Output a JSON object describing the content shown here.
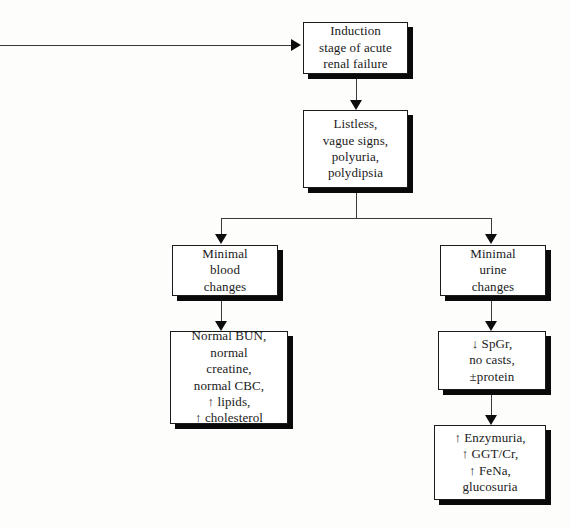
{
  "diagram": {
    "background_color": "#fdfdfc",
    "line_color": "#3a3a3a",
    "box_border_color": "#1b1b1b",
    "box_fill_color": "#ffffff",
    "shadow_color": "#0a0a0a",
    "nodes": [
      {
        "id": "induction",
        "text": "Induction\nstage of acute\nrenal failure",
        "font_size": 13
      },
      {
        "id": "signs",
        "text": "Listless,\nvague signs,\npolyuria,\npolydipsia",
        "font_size": 13
      },
      {
        "id": "blood-changes",
        "text": "Minimal\nblood\nchanges",
        "font_size": 13
      },
      {
        "id": "urine-changes",
        "text": "Minimal\nurine\nchanges",
        "font_size": 13
      },
      {
        "id": "blood-findings",
        "text": "Normal BUN,\nnormal\ncreatine,\nnormal CBC,\n↑ lipids,\n↑ cholesterol",
        "font_size": 13
      },
      {
        "id": "urine-findings",
        "text": "↓ SpGr,\nno casts,\n±protein",
        "font_size": 13
      },
      {
        "id": "enzymuria-findings",
        "text": "↑ Enzymuria,\n↑ GGT/Cr,\n↑ FeNa,\nglucosuria",
        "font_size": 13
      }
    ],
    "connectors": [
      {
        "id": "inflow-arrow",
        "label": "incoming arrow from left into induction box"
      },
      {
        "id": "induction-to-signs",
        "label": "arrow from induction to clinical signs"
      },
      {
        "id": "signs-split",
        "label": "split from clinical signs to blood and urine branches"
      },
      {
        "id": "blood-to-findings",
        "label": "arrow from minimal blood changes to blood findings"
      },
      {
        "id": "urine-to-findings",
        "label": "arrow from minimal urine changes to urine findings"
      },
      {
        "id": "urine-findings-to-enzymuria",
        "label": "arrow from urine findings to enzymuria findings"
      }
    ]
  }
}
